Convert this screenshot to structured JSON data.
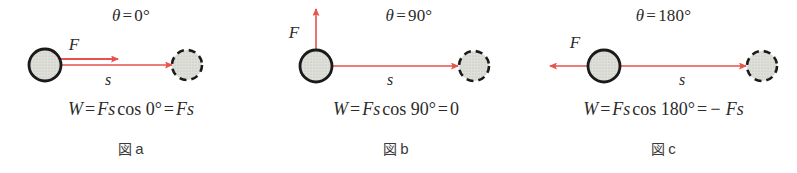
{
  "figure": {
    "background_color": "#ffffff",
    "arrow_color": "#e8524a",
    "ball_fill_color": "#dcdcd6",
    "ball_stroke_color": "#1a1a1a",
    "text_color": "#2b2b2b"
  },
  "panels": [
    {
      "id": "a",
      "angle_label": "θ = 0°",
      "angle_symbol": "θ",
      "angle_value": "0°",
      "force_label": "F",
      "displacement_label": "s",
      "force_direction": "right",
      "force_angle_deg": 0,
      "formula": "W = Fs cos 0° = Fs",
      "formula_parts": {
        "work_symbol": "W",
        "equals": "=",
        "force_symbol": "F",
        "displacement_symbol": "s",
        "cos": "cos",
        "angle": "0°",
        "result": "Fs"
      },
      "caption": "図 a",
      "caption_kanji": "図",
      "caption_letter": "a"
    },
    {
      "id": "b",
      "angle_label": "θ = 90°",
      "angle_symbol": "θ",
      "angle_value": "90°",
      "force_label": "F",
      "displacement_label": "s",
      "force_direction": "up",
      "force_angle_deg": 90,
      "formula": "W = Fs cos 90° = 0",
      "formula_parts": {
        "work_symbol": "W",
        "equals": "=",
        "force_symbol": "F",
        "displacement_symbol": "s",
        "cos": "cos",
        "angle": "90°",
        "result": "0"
      },
      "caption": "図 b",
      "caption_kanji": "図",
      "caption_letter": "b"
    },
    {
      "id": "c",
      "angle_label": "θ = 180°",
      "angle_symbol": "θ",
      "angle_value": "180°",
      "force_label": "F",
      "displacement_label": "s",
      "force_direction": "left",
      "force_angle_deg": 180,
      "formula": "W = Fs cos 180° = − Fs",
      "formula_parts": {
        "work_symbol": "W",
        "equals": "=",
        "force_symbol": "F",
        "displacement_symbol": "s",
        "cos": "cos",
        "angle": "180°",
        "result": "− Fs"
      },
      "caption": "図 c",
      "caption_kanji": "図",
      "caption_letter": "c"
    }
  ]
}
